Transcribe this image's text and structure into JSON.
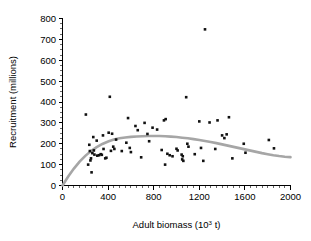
{
  "chart_data": {
    "type": "scatter",
    "title": "",
    "xlabel": "Adult biomass (10³ t)",
    "xlabel_base": "Adult biomass (10",
    "xlabel_exp": "3",
    "xlabel_tail": " t)",
    "ylabel": "Recruitment (millions)",
    "xlim": [
      0,
      2000
    ],
    "ylim": [
      0,
      800
    ],
    "xticks": [
      0,
      400,
      800,
      1200,
      1600,
      2000
    ],
    "yticks": [
      0,
      100,
      200,
      300,
      400,
      500,
      600,
      700,
      800
    ],
    "xtick_labels": [
      "0",
      "400",
      "800",
      "1200",
      "1600",
      "2000"
    ],
    "ytick_labels": [
      "0",
      "100",
      "200",
      "300",
      "400",
      "500",
      "600",
      "700",
      "800"
    ],
    "x_minor_interval": 50,
    "y_minor_interval": 25,
    "grid": false,
    "legend": false,
    "marker": {
      "shape": "square",
      "color": "#111111",
      "size_px": 2.6
    },
    "curve": {
      "name": "Ricker stock-recruitment fit",
      "color": "#a6a6a6",
      "width_px": 2.6,
      "type": "ricker",
      "points": [
        [
          0,
          0
        ],
        [
          50,
          43
        ],
        [
          100,
          81
        ],
        [
          150,
          114
        ],
        [
          200,
          142
        ],
        [
          250,
          165
        ],
        [
          300,
          184
        ],
        [
          350,
          199
        ],
        [
          400,
          211
        ],
        [
          450,
          220
        ],
        [
          500,
          226
        ],
        [
          550,
          230
        ],
        [
          600,
          233
        ],
        [
          650,
          235
        ],
        [
          700,
          236
        ],
        [
          750,
          237
        ],
        [
          800,
          237
        ],
        [
          850,
          237
        ],
        [
          900,
          236
        ],
        [
          950,
          234
        ],
        [
          1000,
          232
        ],
        [
          1050,
          229
        ],
        [
          1100,
          226
        ],
        [
          1150,
          222
        ],
        [
          1200,
          218
        ],
        [
          1250,
          213
        ],
        [
          1300,
          208
        ],
        [
          1350,
          203
        ],
        [
          1400,
          197
        ],
        [
          1450,
          191
        ],
        [
          1500,
          185
        ],
        [
          1550,
          179
        ],
        [
          1600,
          173
        ],
        [
          1650,
          167
        ],
        [
          1700,
          161
        ],
        [
          1750,
          155
        ],
        [
          1800,
          150
        ],
        [
          1850,
          145
        ],
        [
          1900,
          141
        ],
        [
          1950,
          138
        ],
        [
          2000,
          136
        ]
      ]
    },
    "points": [
      [
        205,
        340
      ],
      [
        225,
        100
      ],
      [
        235,
        195
      ],
      [
        240,
        165
      ],
      [
        245,
        120
      ],
      [
        250,
        130
      ],
      [
        255,
        63
      ],
      [
        262,
        155
      ],
      [
        270,
        232
      ],
      [
        275,
        168
      ],
      [
        280,
        148
      ],
      [
        300,
        215
      ],
      [
        305,
        143
      ],
      [
        320,
        145
      ],
      [
        335,
        150
      ],
      [
        345,
        147
      ],
      [
        355,
        240
      ],
      [
        360,
        175
      ],
      [
        375,
        130
      ],
      [
        385,
        133
      ],
      [
        405,
        253
      ],
      [
        415,
        425
      ],
      [
        425,
        166
      ],
      [
        435,
        248
      ],
      [
        445,
        186
      ],
      [
        455,
        175
      ],
      [
        470,
        220
      ],
      [
        520,
        165
      ],
      [
        560,
        205
      ],
      [
        575,
        323
      ],
      [
        590,
        180
      ],
      [
        600,
        160
      ],
      [
        640,
        285
      ],
      [
        660,
        265
      ],
      [
        690,
        135
      ],
      [
        720,
        300
      ],
      [
        745,
        247
      ],
      [
        760,
        212
      ],
      [
        790,
        277
      ],
      [
        830,
        268
      ],
      [
        870,
        170
      ],
      [
        890,
        312
      ],
      [
        900,
        100
      ],
      [
        905,
        318
      ],
      [
        920,
        152
      ],
      [
        940,
        145
      ],
      [
        965,
        140
      ],
      [
        1000,
        176
      ],
      [
        1010,
        168
      ],
      [
        1045,
        148
      ],
      [
        1050,
        125
      ],
      [
        1055,
        140
      ],
      [
        1060,
        118
      ],
      [
        1085,
        423
      ],
      [
        1095,
        200
      ],
      [
        1105,
        186
      ],
      [
        1160,
        150
      ],
      [
        1200,
        307
      ],
      [
        1215,
        180
      ],
      [
        1235,
        118
      ],
      [
        1250,
        748
      ],
      [
        1290,
        302
      ],
      [
        1340,
        175
      ],
      [
        1360,
        312
      ],
      [
        1400,
        240
      ],
      [
        1420,
        227
      ],
      [
        1440,
        245
      ],
      [
        1460,
        327
      ],
      [
        1490,
        130
      ],
      [
        1590,
        200
      ],
      [
        1605,
        157
      ],
      [
        1810,
        218
      ],
      [
        1855,
        178
      ]
    ]
  }
}
